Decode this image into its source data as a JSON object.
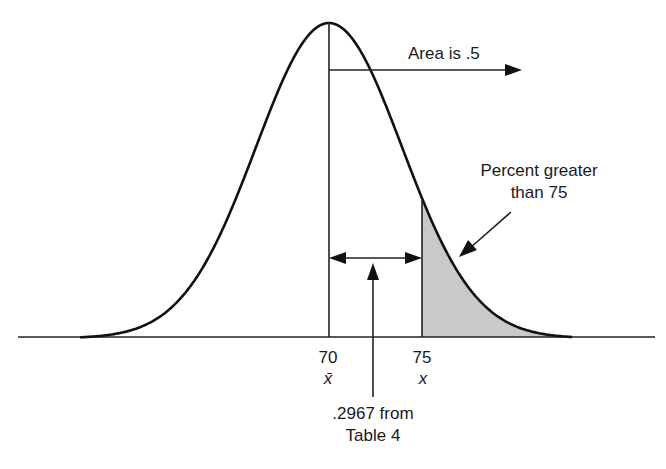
{
  "diagram": {
    "type": "normal-distribution",
    "mean_label": "70",
    "mean_symbol": "x̄",
    "x_label": "75",
    "x_symbol": "x",
    "annotations": {
      "area_half": "Area is .5",
      "percent_greater_line1": "Percent greater",
      "percent_greater_line2": "than 75",
      "table_value_line1": ".2967 from",
      "table_value_line2": "Table 4"
    },
    "colors": {
      "curve": "#111111",
      "shade": "#c8c8c8",
      "background": "#ffffff"
    }
  }
}
